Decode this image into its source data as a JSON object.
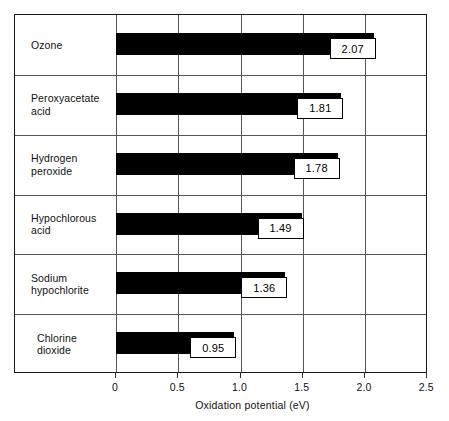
{
  "chart_data": {
    "type": "bar",
    "orientation": "horizontal",
    "title": "",
    "xlabel": "Oxidation potential (eV)",
    "ylabel": "",
    "xlim": [
      0,
      2.5
    ],
    "xticks": [
      "0",
      "0.5",
      "1.0",
      "1.5",
      "2.0",
      "2.5"
    ],
    "xtick_values": [
      0,
      0.5,
      1.0,
      1.5,
      2.0,
      2.5
    ],
    "grid": true,
    "legend": "none",
    "bar_color": "#000000",
    "categories": [
      "Ozone",
      "Peroxyacetate acid",
      "Hydrogen peroxide",
      "Hypochlorous acid",
      "Sodium hypochlorite",
      "Chlorine dioxide"
    ],
    "values": [
      2.07,
      1.81,
      1.78,
      1.49,
      1.36,
      0.95
    ],
    "data_labels": [
      "2.07",
      "1.81",
      "1.78",
      "1.49",
      "1.36",
      "0.95"
    ]
  },
  "rows": [
    {
      "label": "Ozone",
      "label_lines": "Ozone",
      "value": 2.07,
      "data_label": "2.07"
    },
    {
      "label": "Peroxyacetate acid",
      "label_lines": "Peroxyacetate\nacid",
      "value": 1.81,
      "data_label": "1.81"
    },
    {
      "label": "Hydrogen peroxide",
      "label_lines": "Hydrogen\nperoxide",
      "value": 1.78,
      "data_label": "1.78"
    },
    {
      "label": "Hypochlorous acid",
      "label_lines": "Hypochlorous\nacid",
      "value": 1.49,
      "data_label": "1.49"
    },
    {
      "label": "Sodium hypochlorite",
      "label_lines": "Sodium\nhypochlorite",
      "value": 1.36,
      "data_label": "1.36"
    },
    {
      "label": "Chlorine dioxide",
      "label_lines": "Chlorine\ndioxide",
      "value": 0.95,
      "data_label": "0.95"
    }
  ],
  "axis": {
    "title": "Oxidation potential (eV)",
    "ticks": [
      {
        "label": "0"
      },
      {
        "label": "0.5"
      },
      {
        "label": "1.0"
      },
      {
        "label": "1.5"
      },
      {
        "label": "2.0"
      },
      {
        "label": "2.5"
      }
    ]
  },
  "colors": {
    "bar": "#000000",
    "frame": "#1a1a1a",
    "grid": "#555555",
    "background": "#ffffff",
    "text": "#111111"
  }
}
